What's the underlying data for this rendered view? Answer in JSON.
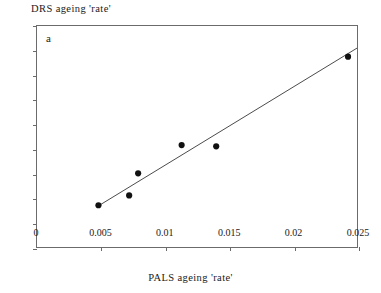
{
  "chart_data": {
    "type": "scatter",
    "title": "",
    "panel_label": "a",
    "xlabel": "PALS ageing 'rate'",
    "ylabel": "DRS ageing 'rate'",
    "xlim": [
      0,
      0.025
    ],
    "ylim": [
      0,
      1.8
    ],
    "xticks": [
      0,
      0.005,
      0.01,
      0.015,
      0.02,
      0.025
    ],
    "xtick_labels": [
      "0",
      "0.005",
      "0.01",
      "0.015",
      "0.02",
      "0.025"
    ],
    "yticks": [
      0,
      0.2,
      0.4,
      0.6,
      0.8,
      1,
      1.2,
      1.4,
      1.6,
      1.8
    ],
    "ytick_labels": [
      "0",
      "0.2",
      "0.4",
      "0.6",
      "0.8",
      "1",
      "1.2",
      "1.4",
      "1.6",
      "1.8"
    ],
    "grid": false,
    "legend": null,
    "marker_color": "#111111",
    "line_color": "#4a4a4a",
    "points": [
      {
        "x": 0.0048,
        "y": 0.34
      },
      {
        "x": 0.0072,
        "y": 0.42
      },
      {
        "x": 0.0079,
        "y": 0.6
      },
      {
        "x": 0.0113,
        "y": 0.83
      },
      {
        "x": 0.014,
        "y": 0.82
      },
      {
        "x": 0.0243,
        "y": 1.55
      }
    ],
    "series": [
      {
        "name": "trend line",
        "type": "line",
        "x": [
          0.0048,
          0.025
        ],
        "y": [
          0.335,
          1.62
        ]
      }
    ]
  }
}
